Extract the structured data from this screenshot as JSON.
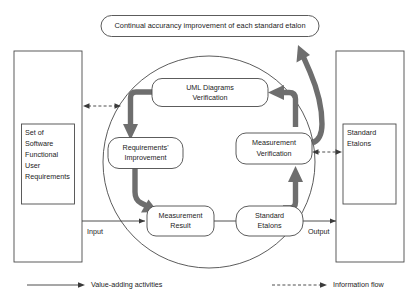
{
  "diagram": {
    "banner": {
      "label": "Continual accurancy improvement of each standard etalon"
    },
    "left_box": {
      "lines": [
        "Set of",
        "Software",
        "Functional",
        "User",
        "Requirements"
      ],
      "line0": "Set of",
      "line1": "Software",
      "line2": "Functional",
      "line3": "User",
      "line4": "Requirements"
    },
    "right_box": {
      "lines": [
        "Standard",
        "Etalons"
      ],
      "line0": "Standard",
      "line1": "Etalons"
    },
    "cycle_nodes": [
      {
        "id": "uml-diagrams-verification",
        "line0": "UML Diagrams",
        "line1": "Verification"
      },
      {
        "id": "measurement-verification",
        "line0": "Measurement",
        "line1": "Verification"
      },
      {
        "id": "standard-etalons",
        "line0": "Standard",
        "line1": "Etalons"
      },
      {
        "id": "measurement-result",
        "line0": "Measurement",
        "line1": "Result"
      },
      {
        "id": "requirements-improvement",
        "line0": "Requirements'",
        "line1": "Improvement"
      }
    ],
    "flow_labels": {
      "input": "Input",
      "output": "Output"
    },
    "legend": {
      "items": [
        {
          "id": "value-adding-activities",
          "label": "Value-adding activities",
          "style": "solid"
        },
        {
          "id": "information-flow",
          "label": "Information flow",
          "style": "dashed"
        }
      ],
      "item0_label": "Value-adding activities",
      "item1_label": "Information flow"
    },
    "colors": {
      "outline": "#4a4a4a",
      "cycle_arrow": "#6e6e6e",
      "flow_line": "#3a3a3a",
      "text": "#1c1c1c",
      "background": "#ffffff"
    }
  }
}
